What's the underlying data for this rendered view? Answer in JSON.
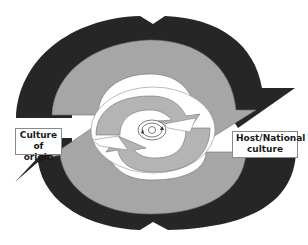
{
  "diagram": {
    "labels": {
      "left": "Culture of origin",
      "left_line1": "Culture of",
      "left_line2": "origin",
      "right": "Host/National culture",
      "right_line1": "Host/National",
      "right_line2": "culture"
    },
    "colors": {
      "outer_arrows": "#2a2a2a",
      "middle_arrows": "#a6a6a6",
      "inner_arrows": "#b4b4b4",
      "background": "#ffffff",
      "stroke": "#555555"
    },
    "layers": [
      {
        "name": "outer",
        "description": "Two large dark circular arrows rotating clockwise"
      },
      {
        "name": "middle",
        "description": "Two gray circular arrows rotating clockwise"
      },
      {
        "name": "inner",
        "description": "Two light gray circular arrows"
      },
      {
        "name": "center",
        "description": "Small concentric circles with tiny arrowheads"
      }
    ]
  }
}
